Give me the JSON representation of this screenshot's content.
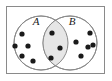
{
  "figure": {
    "name": "venn-diagram",
    "type": "venn-2set",
    "background_color": "#ffffff"
  },
  "universal_set_frame": {
    "name": "universal-set-rectangle",
    "x": 6.5,
    "y": 6.5,
    "width": 98,
    "height": 67,
    "stroke_color": "#8a8a8a",
    "fill_color": "#ffffff",
    "stroke_width": 1
  },
  "outer_shadow_edge": {
    "color": "#c9c9c9"
  },
  "sets": [
    {
      "id": "A",
      "label": "A",
      "label_x": 36,
      "label_y": 25,
      "circle": {
        "cx": 41,
        "cy": 43,
        "r": 27
      },
      "stroke_color": "#8a8a8a",
      "fill_color": "#ffffff"
    },
    {
      "id": "B",
      "label": "B",
      "label_x": 72,
      "label_y": 25,
      "circle": {
        "cx": 70,
        "cy": 43,
        "r": 27
      },
      "stroke_color": "#8a8a8a",
      "fill_color": "#ffffff"
    }
  ],
  "intersection": {
    "name": "a-intersect-b",
    "fill_color": "#e6e6e6",
    "stroke_color": "#8a8a8a",
    "element_count": 3
  },
  "dot_style": {
    "radius": 2.6,
    "color": "#1a1a1a"
  },
  "regions": {
    "a_only": {
      "label": "A only",
      "count": 5,
      "dots": [
        {
          "x": 22,
          "y": 34
        },
        {
          "x": 15,
          "y": 46
        },
        {
          "x": 28,
          "y": 46
        },
        {
          "x": 22,
          "y": 56
        },
        {
          "x": 33,
          "y": 61
        }
      ]
    },
    "intersection": {
      "label": "A and B",
      "count": 3,
      "dots": [
        {
          "x": 52,
          "y": 33
        },
        {
          "x": 60,
          "y": 48
        },
        {
          "x": 51,
          "y": 58
        }
      ]
    },
    "b_only": {
      "label": "B only",
      "count": 5,
      "dots": [
        {
          "x": 90,
          "y": 33
        },
        {
          "x": 76,
          "y": 42
        },
        {
          "x": 88,
          "y": 47
        },
        {
          "x": 81,
          "y": 56
        },
        {
          "x": 93,
          "y": 45
        }
      ]
    }
  },
  "totals": {
    "total_elements": 13
  }
}
